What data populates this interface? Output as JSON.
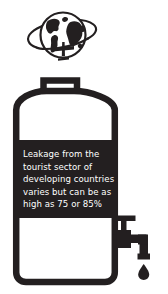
{
  "graphic": {
    "title": "Tourism leakage water tank infographic",
    "icons": {
      "globe": "globe-with-orbiting-airplane-icon",
      "tank": "water-tank-icon",
      "faucet": "faucet-tap-icon",
      "drip": "water-droplet-icon"
    }
  },
  "callout": {
    "text": "Leakage from the tourist sector of developing countries varies but can be as high as 75 or 85%",
    "lines": [
      "Leakage from the",
      "tourist sector of",
      "developing countries",
      "varies but can be as",
      "high as 75 or 85%"
    ],
    "values": {
      "low_percent": "75",
      "high_percent": "85%"
    }
  },
  "colors": {
    "ink": "#231f20",
    "band": "#231f20",
    "text": "#ffffff",
    "background": "#ffffff"
  }
}
